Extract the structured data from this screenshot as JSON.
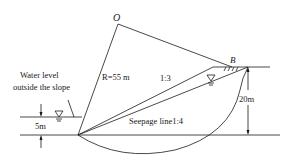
{
  "diagram": {
    "type": "slope stability circular slip surface",
    "labels": {
      "center": "O",
      "point_b": "B",
      "radius": "R=55 m",
      "slope_ratio": "1:3",
      "seepage": "Seepage line1:4",
      "water_level_1": "Water level",
      "water_level_2": "outside the slope",
      "water_depth": "5m",
      "height": "20m"
    },
    "colors": {
      "line": "#1a1a1a",
      "background": "#ffffff"
    }
  }
}
